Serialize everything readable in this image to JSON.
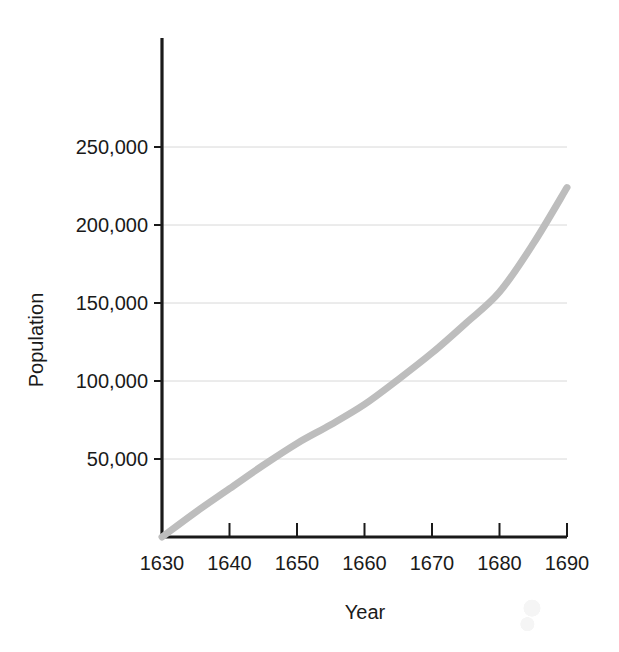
{
  "chart_data": {
    "type": "line",
    "title": "",
    "xlabel": "Year",
    "ylabel": "Population",
    "xlim": [
      1630,
      1690
    ],
    "ylim": [
      0,
      275000
    ],
    "grid": true,
    "legend": null,
    "x_ticks": [
      1630,
      1640,
      1650,
      1660,
      1670,
      1680,
      1690
    ],
    "x_tick_labels": [
      "1630",
      "1640",
      "1650",
      "1660",
      "1670",
      "1680",
      "1690"
    ],
    "y_ticks": [
      50000,
      100000,
      150000,
      200000,
      250000
    ],
    "y_tick_labels": [
      "50,000",
      "100,000",
      "150,000",
      "200,000",
      "250,000"
    ],
    "series": [
      {
        "name": "Population",
        "color": "#bdbdbd",
        "line_width": 7,
        "x": [
          1630,
          1635,
          1640,
          1645,
          1650,
          1655,
          1660,
          1665,
          1670,
          1675,
          1680,
          1685,
          1690
        ],
        "values": [
          0,
          16000,
          31000,
          46000,
          60000,
          72000,
          85000,
          101000,
          118000,
          137000,
          157000,
          188000,
          224000
        ]
      }
    ]
  },
  "axes": {
    "y_label": "Population",
    "x_label": "Year"
  },
  "colors": {
    "axis": "#1a1a1a",
    "grid": "#d8d8d8",
    "series": "#bdbdbd",
    "background": "#ffffff",
    "text": "#1a1a1a"
  }
}
